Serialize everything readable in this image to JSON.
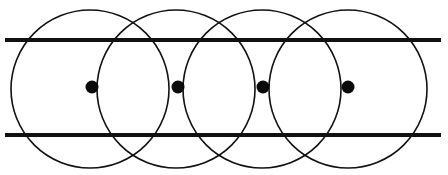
{
  "figure": {
    "canvas": {
      "width": 448,
      "height": 175,
      "background": "#ffffff"
    },
    "colors": {
      "stroke": "#111111",
      "dot_fill": "#0a0a0a",
      "background": "#ffffff"
    },
    "circles": [
      {
        "label": "circle-1",
        "cx": 90,
        "cy": 89,
        "r": 79,
        "stroke_width": 1.6
      },
      {
        "label": "circle-2",
        "cx": 176,
        "cy": 89,
        "r": 79,
        "stroke_width": 1.6
      },
      {
        "label": "circle-3",
        "cx": 262,
        "cy": 89,
        "r": 79,
        "stroke_width": 1.6
      },
      {
        "label": "circle-4",
        "cx": 348,
        "cy": 89,
        "r": 79,
        "stroke_width": 1.6
      }
    ],
    "dots": [
      {
        "label": "center-dot-1",
        "cx": 92,
        "cy": 87,
        "r": 6.5
      },
      {
        "label": "center-dot-2",
        "cx": 178,
        "cy": 87,
        "r": 6.5
      },
      {
        "label": "center-dot-3",
        "cx": 263,
        "cy": 87,
        "r": 6.5
      },
      {
        "label": "center-dot-4",
        "cx": 348,
        "cy": 87,
        "r": 6.5
      }
    ],
    "lines": [
      {
        "label": "top-line",
        "x1": 5,
        "y1": 40,
        "x2": 441,
        "y2": 40,
        "stroke_width": 4.2
      },
      {
        "label": "bottom-line",
        "x1": 5,
        "y1": 135,
        "x2": 441,
        "y2": 135,
        "stroke_width": 4.2
      }
    ],
    "counts": {
      "circles": 4,
      "dots": 4,
      "lines": 2
    }
  }
}
